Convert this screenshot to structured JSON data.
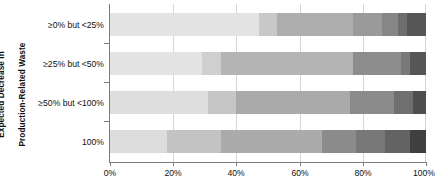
{
  "chart_data": {
    "type": "bar",
    "orientation": "horizontal",
    "stacked": true,
    "stack_unit": "percent",
    "title": "",
    "subtitle": "",
    "xlabel": "",
    "ylabel": "Expected Decrease in Production-Related Waste",
    "ylabel_lines": [
      "Expected Decrease in",
      "Production-Related Waste"
    ],
    "xlim": [
      0,
      100
    ],
    "xticks": [
      0,
      20,
      40,
      60,
      80,
      100
    ],
    "xticklabels": [
      "0%",
      "20%",
      "40%",
      "60%",
      "80%",
      "100%"
    ],
    "grid": true,
    "grid_axis": "x",
    "legend": false,
    "legend_position": "none",
    "categories": [
      "≥0% but <25%",
      "≥25% but <50%",
      "≥50% but <100%",
      "100%"
    ],
    "segment_colors": [
      "#e3e3e3",
      "#d2d2d2",
      "#c0c0c0",
      "#a8a8a8",
      "#8f8f8f",
      "#767676",
      "#5e5e5e",
      "#444444"
    ],
    "series": [
      {
        "name": "Segment 1",
        "values": [
          47,
          29,
          31,
          18
        ]
      },
      {
        "name": "Segment 2",
        "values": [
          6,
          6,
          9,
          17
        ]
      },
      {
        "name": "Segment 3",
        "values": [
          24,
          42,
          36,
          32
        ]
      },
      {
        "name": "Segment 4",
        "values": [
          9,
          15,
          14,
          11
        ]
      },
      {
        "name": "Segment 5",
        "values": [
          5,
          3,
          6,
          9
        ]
      },
      {
        "name": "Segment 6",
        "values": [
          3,
          2,
          1,
          8
        ]
      },
      {
        "name": "Segment 7",
        "values": [
          6,
          3,
          3,
          5
        ]
      }
    ],
    "bars": [
      {
        "category": "≥0% but <25%",
        "segments": [
          {
            "value": 47,
            "color": "#e3e3e3"
          },
          {
            "value": 6,
            "color": "#c8c8c8"
          },
          {
            "value": 24,
            "color": "#aeaeae"
          },
          {
            "value": 9,
            "color": "#9a9a9a"
          },
          {
            "value": 5,
            "color": "#868686"
          },
          {
            "value": 3,
            "color": "#6e6e6e"
          },
          {
            "value": 6,
            "color": "#565656"
          }
        ]
      },
      {
        "category": "≥25% but <50%",
        "segments": [
          {
            "value": 29,
            "color": "#e3e3e3"
          },
          {
            "value": 6,
            "color": "#cfcfcf"
          },
          {
            "value": 42,
            "color": "#b4b4b4"
          },
          {
            "value": 15,
            "color": "#8d8d8d"
          },
          {
            "value": 3,
            "color": "#797979"
          },
          {
            "value": 5,
            "color": "#565656"
          }
        ]
      },
      {
        "category": "≥50% but <100%",
        "segments": [
          {
            "value": 31,
            "color": "#dedede"
          },
          {
            "value": 9,
            "color": "#c6c6c6"
          },
          {
            "value": 36,
            "color": "#aaaaaa"
          },
          {
            "value": 14,
            "color": "#8b8b8b"
          },
          {
            "value": 6,
            "color": "#6f6f6f"
          },
          {
            "value": 4,
            "color": "#4e4e4e"
          }
        ]
      },
      {
        "category": "100%",
        "segments": [
          {
            "value": 18,
            "color": "#dcdcdc"
          },
          {
            "value": 17,
            "color": "#c3c3c3"
          },
          {
            "value": 32,
            "color": "#ababab"
          },
          {
            "value": 11,
            "color": "#8c8c8c"
          },
          {
            "value": 9,
            "color": "#787878"
          },
          {
            "value": 8,
            "color": "#636363"
          },
          {
            "value": 5,
            "color": "#3f3f3f"
          }
        ]
      }
    ]
  },
  "axis": {
    "x_tick_labels": [
      "0%",
      "20%",
      "40%",
      "60%",
      "80%",
      "100%"
    ],
    "y_title_line1": "Expected Decrease in",
    "y_title_line2": "Production-Related Waste"
  },
  "categories": {
    "c0": "≥0% but <25%",
    "c1": "≥25% but <50%",
    "c2": "≥50% but <100%",
    "c3": "100%"
  },
  "xlabels": {
    "t0": "0%",
    "t1": "20%",
    "t2": "40%",
    "t3": "60%",
    "t4": "80%",
    "t5": "100%"
  },
  "colors": {
    "axis": "#7c7c7c",
    "grid": "#d6d6d6",
    "text": "#111111",
    "background": "#ffffff"
  }
}
